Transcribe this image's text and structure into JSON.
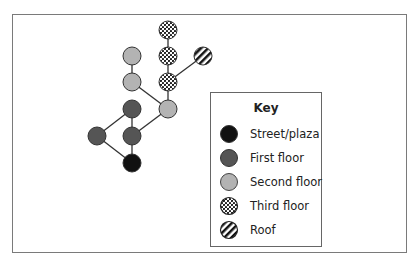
{
  "legend": {
    "title": "Key",
    "items": [
      {
        "id": "street",
        "label": "Street/plaza",
        "fill": "#111111",
        "pattern": "solid"
      },
      {
        "id": "first",
        "label": "First floor",
        "fill": "#555555",
        "pattern": "solid"
      },
      {
        "id": "second",
        "label": "Second floor",
        "fill": "#b3b3b3",
        "pattern": "solid"
      },
      {
        "id": "third",
        "label": "Third floor",
        "fill": "#ffffff",
        "pattern": "dots"
      },
      {
        "id": "roof",
        "label": "Roof",
        "fill": "#ffffff",
        "pattern": "stripes"
      }
    ]
  },
  "graph": {
    "nodes": [
      {
        "id": "t1",
        "level": "third",
        "col": 2,
        "row": 0
      },
      {
        "id": "t2",
        "level": "third",
        "col": 2,
        "row": 1
      },
      {
        "id": "r1",
        "level": "roof",
        "col": 3,
        "row": 1
      },
      {
        "id": "s1",
        "level": "second",
        "col": 1,
        "row": 1
      },
      {
        "id": "t3",
        "level": "third",
        "col": 2,
        "row": 2
      },
      {
        "id": "s2",
        "level": "second",
        "col": 1,
        "row": 2
      },
      {
        "id": "f1",
        "level": "first",
        "col": 1,
        "row": 3
      },
      {
        "id": "s3",
        "level": "second",
        "col": 2,
        "row": 3
      },
      {
        "id": "f2",
        "level": "first",
        "col": 0,
        "row": 4
      },
      {
        "id": "f3",
        "level": "first",
        "col": 1,
        "row": 4
      },
      {
        "id": "p1",
        "level": "street",
        "col": 1,
        "row": 5
      }
    ],
    "edges": [
      [
        "t1",
        "t2"
      ],
      [
        "t2",
        "t3"
      ],
      [
        "r1",
        "t3"
      ],
      [
        "t3",
        "s3"
      ],
      [
        "s1",
        "s2"
      ],
      [
        "s2",
        "s3"
      ],
      [
        "s3",
        "f3"
      ],
      [
        "f1",
        "f3"
      ],
      [
        "f1",
        "f2"
      ],
      [
        "f2",
        "p1"
      ],
      [
        "f3",
        "p1"
      ]
    ]
  }
}
